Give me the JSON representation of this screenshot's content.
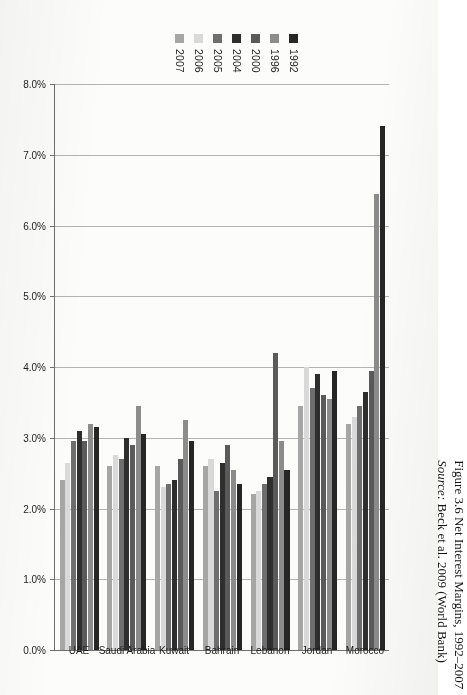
{
  "caption": {
    "title": "Figure 3.6 Net Interest Margins, 1992–2007",
    "source_prefix": "Source:",
    "source_rest": " Beck et al. 2009 (World Bank)"
  },
  "chart_data": {
    "type": "bar",
    "orientation": "horizontal",
    "title": "Figure 3.6 Net Interest Margins, 1992–2007",
    "xlabel": "",
    "ylabel": "",
    "note": "Value axis is reversed on the printed page: 8.0% at left, 0.0% at right; bars extend leftward from the 0.0% baseline.",
    "axis_reversed": true,
    "grid": true,
    "legend_position": "top",
    "xlim": [
      0,
      8
    ],
    "tick_values": [
      8,
      7,
      6,
      5,
      4,
      3,
      2,
      1,
      0
    ],
    "tick_labels": [
      "8.0%",
      "7.0%",
      "6.0%",
      "5.0%",
      "4.0%",
      "3.0%",
      "2.0%",
      "1.0%",
      "0.0%"
    ],
    "categories": [
      "Morocco",
      "Jordan",
      "Lebanon",
      "Bahrain",
      "Kuwait",
      "Saudi Arabia",
      "UAE"
    ],
    "series": [
      {
        "name": "1992",
        "color": "#262626",
        "values": [
          7.4,
          3.95,
          2.55,
          2.35,
          2.95,
          3.05,
          3.15
        ]
      },
      {
        "name": "1996",
        "color": "#8c8c8c",
        "values": [
          6.45,
          3.55,
          2.95,
          2.55,
          3.25,
          3.45,
          3.2
        ]
      },
      {
        "name": "2000",
        "color": "#5a5a5a",
        "values": [
          3.95,
          3.6,
          4.2,
          2.9,
          2.7,
          2.9,
          2.95
        ]
      },
      {
        "name": "2004",
        "color": "#2e2e2e",
        "values": [
          3.65,
          3.9,
          2.45,
          2.65,
          2.4,
          3.0,
          3.1
        ]
      },
      {
        "name": "2005",
        "color": "#6e6e6e",
        "values": [
          3.45,
          3.7,
          2.35,
          2.25,
          2.35,
          2.7,
          2.95
        ]
      },
      {
        "name": "2006",
        "color": "#d9d9d9",
        "values": [
          3.3,
          4.0,
          2.25,
          2.7,
          2.3,
          2.75,
          2.65
        ]
      },
      {
        "name": "2007",
        "color": "#a6a6a6",
        "values": [
          3.2,
          3.45,
          2.2,
          2.6,
          2.6,
          2.6,
          2.4
        ]
      }
    ]
  }
}
